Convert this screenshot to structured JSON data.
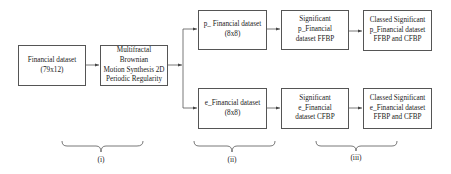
{
  "diagram": {
    "nodes": {
      "financial_dataset": {
        "text": "Financial dataset\n(79x12)"
      },
      "mbm_synthesis": {
        "text": "Multifractal Brownian\nMotion Synthesis 2D\nPeriodic Regularity"
      },
      "p_dataset": {
        "text": "p_ Financial dataset\n(8x8)"
      },
      "e_dataset": {
        "text": "e_Financial dataset\n(8x8)"
      },
      "sig_p": {
        "text": "Significant p_Financial\ndataset FFBP"
      },
      "sig_e": {
        "text": "Significant e_Financial\ndataset CFBP"
      },
      "classed_p": {
        "text": "Classed Significant\np_Financial  dataset\nFFBP and CFBP"
      },
      "classed_e": {
        "text": "Classed Significant\ne_Financial dataset\nFFBP and CFBP"
      }
    },
    "edges": [
      [
        "financial_dataset",
        "mbm_synthesis"
      ],
      [
        "mbm_synthesis",
        "p_dataset"
      ],
      [
        "mbm_synthesis",
        "e_dataset"
      ],
      [
        "p_dataset",
        "sig_p"
      ],
      [
        "e_dataset",
        "sig_e"
      ],
      [
        "sig_p",
        "classed_p"
      ],
      [
        "sig_e",
        "classed_e"
      ]
    ],
    "stages": [
      {
        "label": "(i)"
      },
      {
        "label": "(ii)"
      },
      {
        "label": "(iii)"
      }
    ],
    "colors": {
      "stroke": "#555555",
      "text": "#222222",
      "background": "#ffffff"
    }
  }
}
